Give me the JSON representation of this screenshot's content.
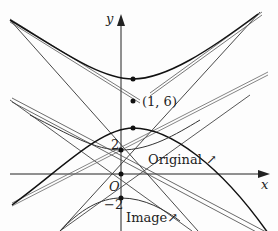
{
  "diagram": {
    "axes": {
      "x_label": "x",
      "y_label": "y",
      "origin_label": "O"
    },
    "point_label": "(1, 6)",
    "tick_labels": {
      "y_pos": "2",
      "y_neg": "−2"
    },
    "curve_labels": {
      "original": "Original",
      "image": "Image"
    },
    "arrow_glyph": "↗"
  }
}
